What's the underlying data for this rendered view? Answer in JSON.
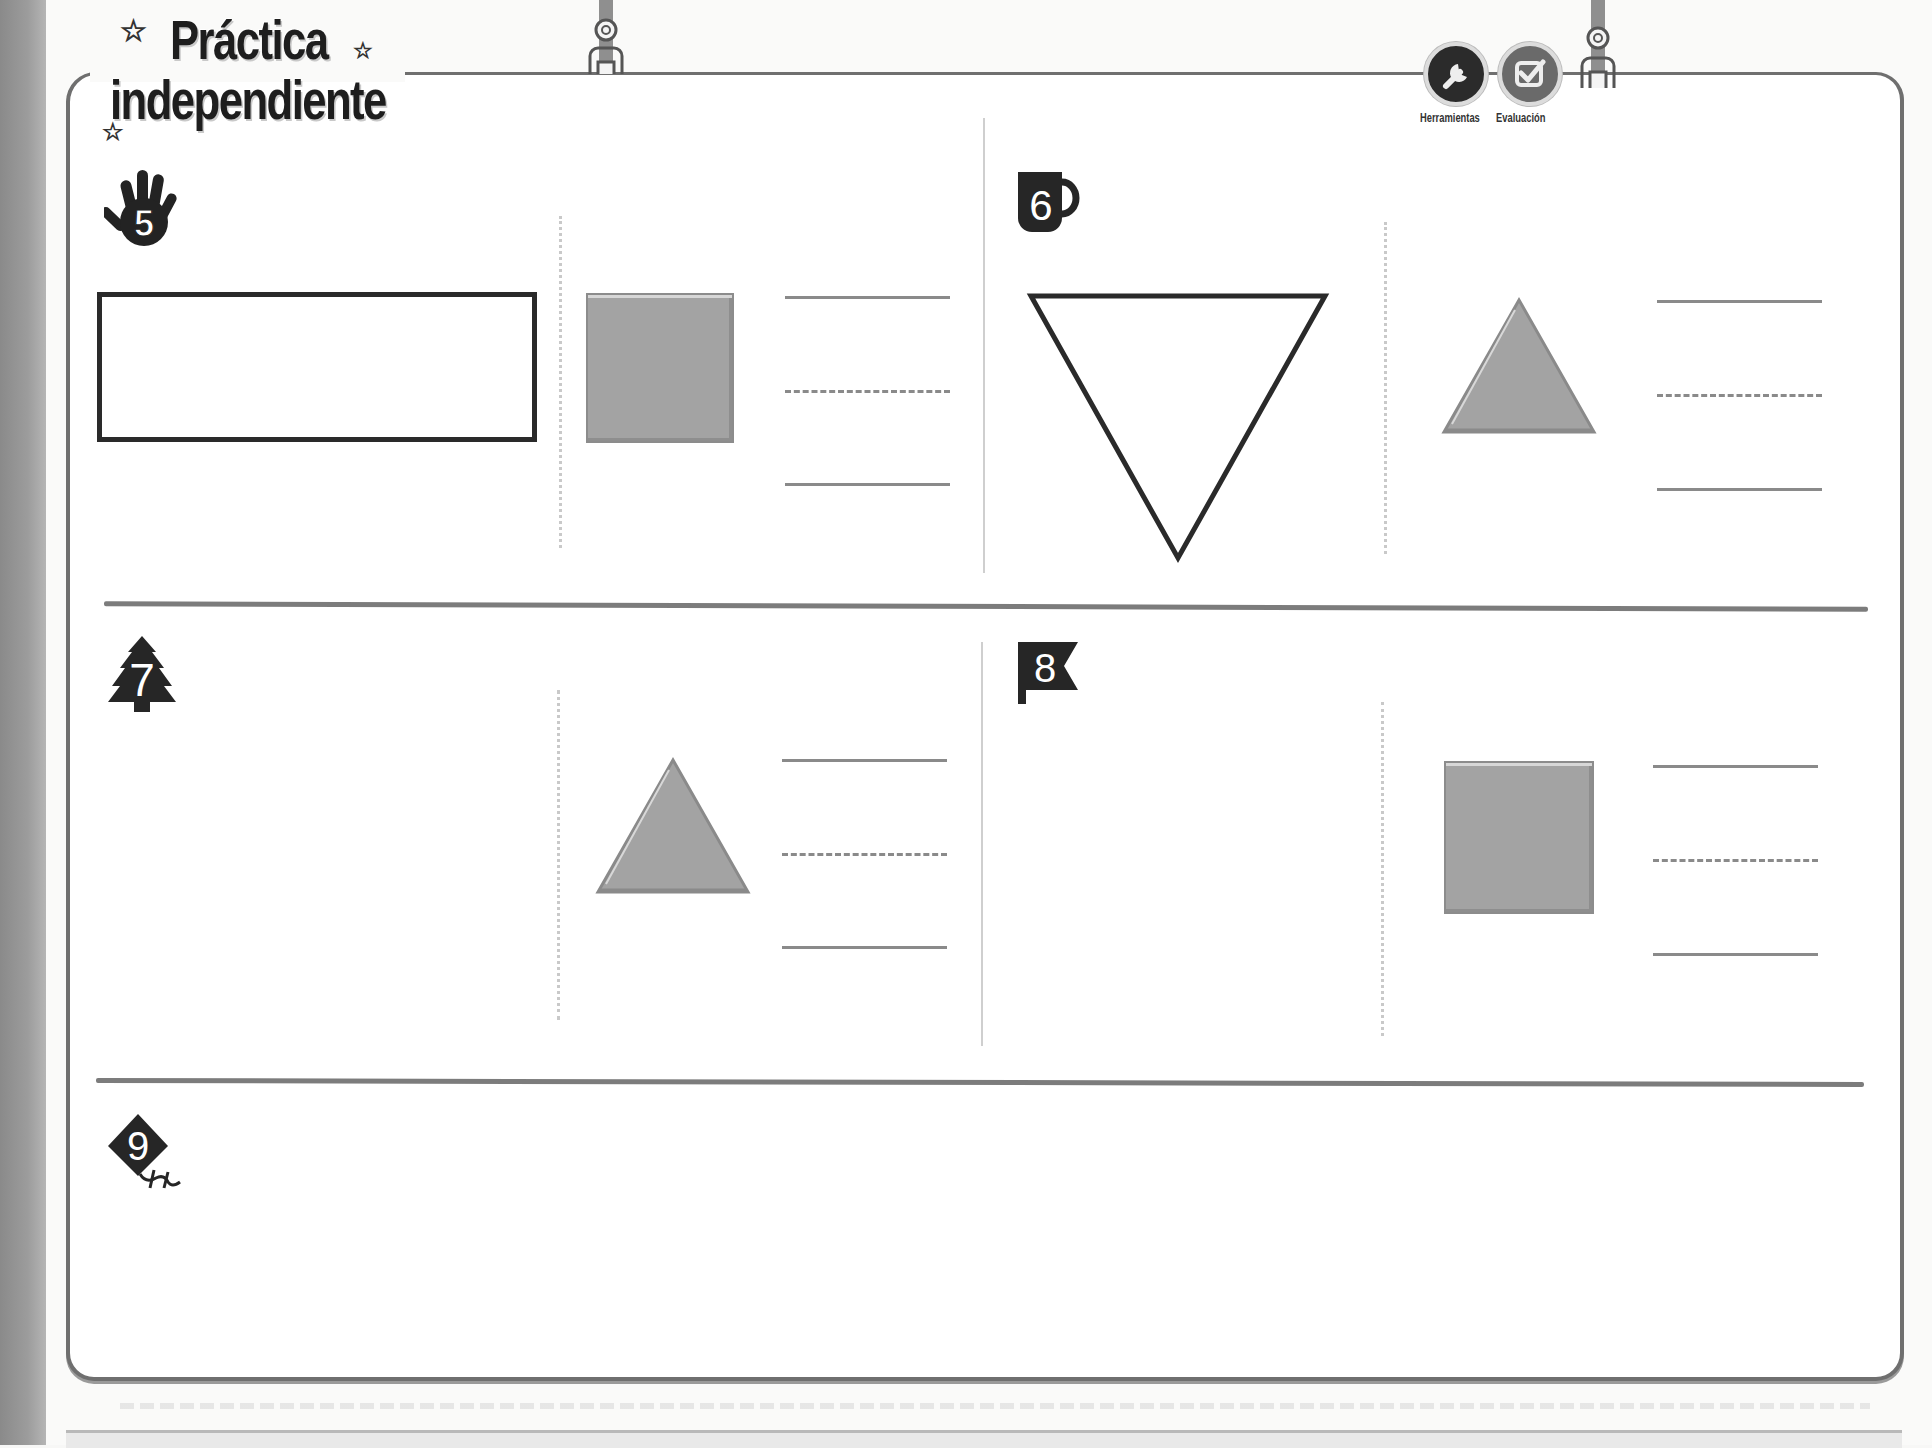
{
  "header": {
    "title_line1": "Práctica",
    "title_line2": "independiente",
    "tools": [
      {
        "icon": "wrench-icon",
        "label": "Herramientas"
      },
      {
        "icon": "checkbox-check-icon",
        "label": "Evaluación"
      }
    ]
  },
  "exercises": [
    {
      "number": "5",
      "icon": "hand-icon",
      "left_shape": "rectangle-outline",
      "model_shape": "square-gray",
      "answer_lines": [
        "solid",
        "dashed",
        "solid"
      ]
    },
    {
      "number": "6",
      "icon": "mug-icon",
      "left_shape": "inverted-triangle-outline",
      "model_shape": "triangle-gray",
      "answer_lines": [
        "solid",
        "dashed",
        "solid"
      ]
    },
    {
      "number": "7",
      "icon": "pine-tree-icon",
      "left_shape": null,
      "model_shape": "triangle-gray",
      "answer_lines": [
        "solid",
        "dashed",
        "solid"
      ]
    },
    {
      "number": "8",
      "icon": "flag-icon",
      "left_shape": null,
      "model_shape": "square-gray",
      "answer_lines": [
        "solid",
        "dashed",
        "solid"
      ]
    },
    {
      "number": "9",
      "icon": "kite-icon",
      "left_shape": null,
      "model_shape": null,
      "answer_lines": []
    }
  ],
  "colors": {
    "frame": "#6f6f6f",
    "shape_fill": "#a3a3a3",
    "ink": "#1e1e1e",
    "line": "#8a8a8a"
  }
}
